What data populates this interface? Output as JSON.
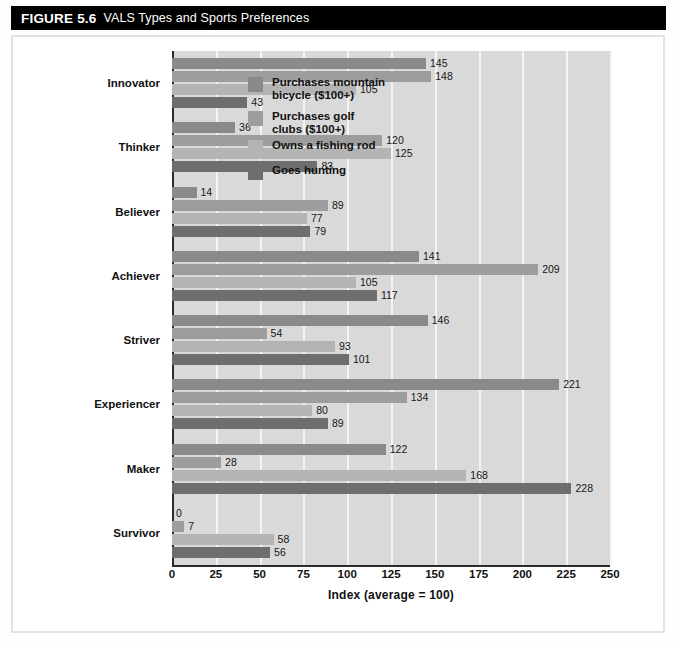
{
  "figure": {
    "number": "FIGURE 5.6",
    "title": "VALS Types and Sports Preferences"
  },
  "chart_data": {
    "type": "bar",
    "orientation": "horizontal",
    "title": "VALS Types and Sports Preferences",
    "xlabel": "Index (average = 100)",
    "ylabel": "",
    "xlim": [
      0,
      250
    ],
    "xticks": [
      "0",
      "25",
      "50",
      "75",
      "100",
      "125",
      "150",
      "175",
      "200",
      "225",
      "250"
    ],
    "grid": "vertical",
    "legend_position": "inside-upper-right",
    "categories": [
      "Innovator",
      "Thinker",
      "Believer",
      "Achiever",
      "Striver",
      "Experiencer",
      "Maker",
      "Survivor"
    ],
    "series": [
      {
        "name": "Purchases mountain\nbicycle ($100+)",
        "color": "#8a8a8a",
        "values": [
          145,
          36,
          14,
          141,
          146,
          221,
          122,
          0
        ]
      },
      {
        "name": "Purchases golf\nclubs ($100+)",
        "color": "#9d9d9d",
        "values": [
          148,
          120,
          89,
          209,
          54,
          134,
          28,
          7
        ]
      },
      {
        "name": "Owns a fishing rod",
        "color": "#b4b4b4",
        "values": [
          105,
          125,
          77,
          105,
          93,
          80,
          168,
          58
        ]
      },
      {
        "name": "Goes hunting",
        "color": "#6e6e6e",
        "values": [
          43,
          83,
          79,
          117,
          101,
          89,
          228,
          56
        ]
      }
    ]
  }
}
